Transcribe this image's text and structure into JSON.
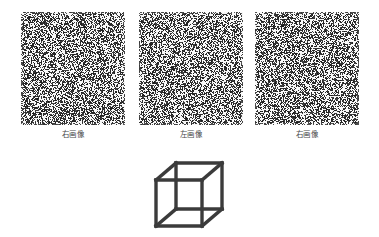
{
  "figure": {
    "background_color": "#ffffff",
    "ink_color": "#3b3b3b",
    "caption_color": "#4a4a4a",
    "panels": [
      {
        "id": "panel-1",
        "caption": "右画像",
        "caption_romaji": "migi gazou",
        "caption_meaning": "right image",
        "pattern": "random-dot-noise",
        "seed": 1307,
        "density": 0.5,
        "dot_color": "#2f2f2f",
        "background_color": "#ffffff",
        "left": 21,
        "top": 12,
        "width": 104,
        "height": 113
      },
      {
        "id": "panel-2",
        "caption": "左画像",
        "caption_romaji": "hidari gazou",
        "caption_meaning": "left image",
        "pattern": "random-dot-noise",
        "seed": 48211,
        "density": 0.5,
        "dot_color": "#2f2f2f",
        "background_color": "#ffffff",
        "left": 139,
        "top": 12,
        "width": 104,
        "height": 113
      },
      {
        "id": "panel-3",
        "caption": "右画像",
        "caption_romaji": "migi gazou",
        "caption_meaning": "right image",
        "pattern": "random-dot-noise",
        "seed": 990317,
        "density": 0.5,
        "dot_color": "#2f2f2f",
        "background_color": "#ffffff",
        "left": 255,
        "top": 12,
        "width": 104,
        "height": 113
      }
    ],
    "cube": {
      "label": "wireframe-cube",
      "type": "necker-cube",
      "stroke_color": "#3b3b3b",
      "stroke_width": 3.4,
      "left": 152,
      "top": 158,
      "width": 78,
      "height": 76,
      "vertices": {
        "front_top_left": [
          4,
          22
        ],
        "front_top_right": [
          50,
          22
        ],
        "front_bottom_right": [
          50,
          68
        ],
        "front_bottom_left": [
          4,
          68
        ],
        "back_top_left": [
          24,
          5
        ],
        "back_top_right": [
          70,
          5
        ],
        "back_bottom_right": [
          70,
          51
        ],
        "back_bottom_left": [
          24,
          51
        ]
      }
    }
  }
}
